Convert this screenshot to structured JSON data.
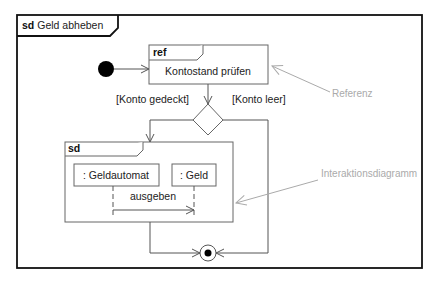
{
  "diagram": {
    "type": "UML interaction overview diagram",
    "frame": {
      "keyword": "sd",
      "title": "Geld abheben"
    },
    "ref_node": {
      "keyword": "ref",
      "label": "Kontostand prüfen"
    },
    "decision": {
      "guards": [
        "[Konto gedeckt]",
        "[Konto leer]"
      ]
    },
    "interaction": {
      "keyword": "sd",
      "lifelines": [
        ": Geldautomat",
        ": Geld"
      ],
      "message": "ausgeben"
    },
    "annotations": {
      "referenz": "Referenz",
      "interaktionsdiagramm": "Interaktionsdiagramm"
    },
    "colors": {
      "frame": "#111111",
      "lines": "#555555",
      "annotation": "#aaaaaa"
    }
  }
}
